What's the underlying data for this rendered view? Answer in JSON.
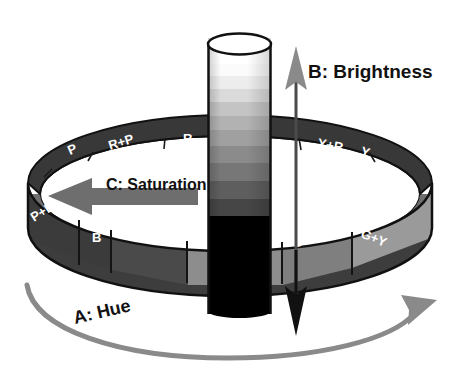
{
  "figure": {
    "background_color": "#ffffff"
  },
  "axes": [
    {
      "id": "hue",
      "label": "A: Hue",
      "arrow": "curved-arc-arrow-right",
      "color": "#8a8a8a"
    },
    {
      "id": "brightness",
      "label": "B: Brightness",
      "arrow": "vertical-double-arrow",
      "up_arrow_color": "#8a8a8a",
      "down_arrow_color": "#111111"
    },
    {
      "id": "saturation",
      "label": "C: Saturation",
      "arrow": "horizontal-left-arrow",
      "color": "#6e6e6e"
    }
  ],
  "hue_ring": {
    "name": "hue-ring",
    "back_segments": [
      {
        "label": "P",
        "fill": "#3a3a3a"
      },
      {
        "label": "R+P",
        "fill": "#3f3f3f"
      },
      {
        "label": "R",
        "fill": "#4a4a4a"
      },
      {
        "label": "",
        "fill": "#454545"
      },
      {
        "label": "",
        "fill": "#3d3d3d"
      },
      {
        "label": "Y+R",
        "fill": "#343434"
      },
      {
        "label": "Y",
        "fill": "#2e2e2e"
      }
    ],
    "front_segments": [
      {
        "label": "P+B",
        "fill": "#3b3b3b"
      },
      {
        "label": "B",
        "fill": "#4a4a4a"
      },
      {
        "label": "B+G",
        "fill": "#8d8d8d"
      },
      {
        "label": "G",
        "fill": "#7f7f7f"
      },
      {
        "label": "G+Y",
        "fill": "#9a9a9a"
      }
    ],
    "outline_color": "#111111",
    "inner_fill": "#ffffff"
  },
  "brightness_cylinder": {
    "name": "brightness-cylinder",
    "top_cap_fill": "#ffffff",
    "outline_color": "#111111",
    "bands": [
      {
        "value": "#ffffff"
      },
      {
        "value": "#f2f2f2"
      },
      {
        "value": "#dcdcdc"
      },
      {
        "value": "#c6c6c6"
      },
      {
        "value": "#b0b0b0"
      },
      {
        "value": "#9a9a9a"
      },
      {
        "value": "#7d7d7d"
      },
      {
        "value": "#636363"
      },
      {
        "value": "#4a4a4a"
      },
      {
        "value": "#000000"
      }
    ]
  }
}
